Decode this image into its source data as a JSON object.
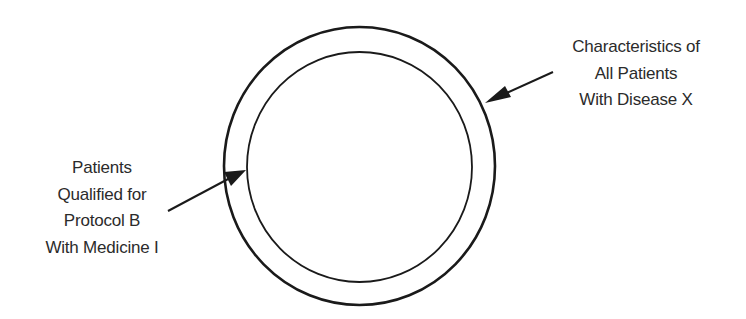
{
  "diagram": {
    "type": "nested-circles",
    "outer_circle": {
      "label_lines": [
        "Characteristics of",
        "All Patients",
        "With Disease X"
      ]
    },
    "inner_circle": {
      "label_lines": [
        "Patients",
        "Qualified for",
        "Protocol B",
        "With Medicine I"
      ]
    },
    "colors": {
      "stroke": "#1a1a1a",
      "text": "#2b2b2b",
      "background": "#ffffff"
    }
  }
}
